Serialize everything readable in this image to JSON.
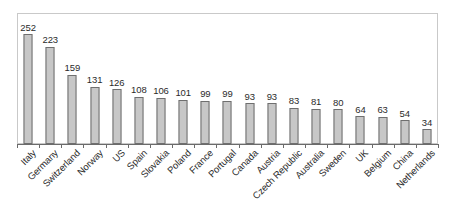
{
  "chart_data": {
    "type": "bar",
    "title": "",
    "subtitle": "",
    "xlabel": "",
    "ylabel": "",
    "grid": false,
    "legend": false,
    "axis_tick_labels_y": [],
    "ylim": [
      0,
      252
    ],
    "value_labels_shown": true,
    "label_rotation_deg": -45,
    "categories": [
      "Italy",
      "Germany",
      "Switzerland",
      "Norway",
      "US",
      "Spain",
      "Slovakia",
      "Poland",
      "France",
      "Portugal",
      "Canada",
      "Austria",
      "Czech Republic",
      "Australia",
      "Sweden",
      "UK",
      "Belgium",
      "China",
      "Netherlands"
    ],
    "values": [
      252,
      223,
      159,
      131,
      126,
      108,
      106,
      101,
      99,
      99,
      93,
      93,
      83,
      81,
      80,
      64,
      63,
      54,
      34
    ]
  },
  "style": {
    "bar_fill": "#c7c7c7",
    "bar_stroke": "#6f6f6f",
    "frame_stroke": "#c9c9c9",
    "axis_stroke": "#6b6b6b",
    "text_color": "#2b2b2b",
    "background": "#ffffff"
  }
}
